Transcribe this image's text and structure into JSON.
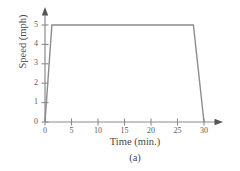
{
  "chart_data": {
    "type": "line",
    "title": "",
    "subtitle": "",
    "caption": "(a)",
    "xlabel": "Time (min.)",
    "ylabel": "Speed (mph)",
    "xlim": [
      0,
      32.5
    ],
    "ylim": [
      0,
      5.4
    ],
    "xticks": [
      0,
      5,
      10,
      15,
      20,
      25,
      30
    ],
    "yticks": [
      0,
      1,
      2,
      3,
      4,
      5
    ],
    "xtick_labels": [
      "0",
      "5",
      "10",
      "15",
      "20",
      "25",
      "30"
    ],
    "ytick_labels": [
      "0",
      "1",
      "2",
      "3",
      "4",
      "5"
    ],
    "grid": false,
    "legend": null,
    "annotations": [],
    "series": [
      {
        "name": "Speed",
        "color": "#8c8c8c",
        "x": [
          0,
          1.3,
          28,
          30
        ],
        "y": [
          0,
          5,
          5,
          0
        ]
      }
    ]
  },
  "figure": {
    "axis_color": "#8c8c8c",
    "text_color": "#4a4a4a",
    "x_axis_arrow": true,
    "y_axis_arrow": true
  }
}
